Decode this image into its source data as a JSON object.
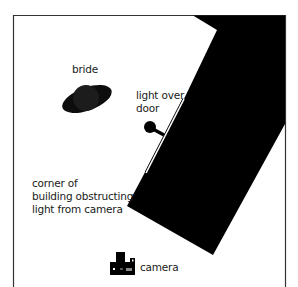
{
  "diagram": {
    "labels": {
      "bride": "bride",
      "light_line1": "light over",
      "light_line2": "door",
      "corner_line1": "corner of",
      "corner_line2": "building obstructing",
      "corner_line3": "light from camera",
      "camera": "camera"
    },
    "colors": {
      "background": "#ffffff",
      "frame": "#333333",
      "building": "#000000",
      "bride": "#111111",
      "door": "#ffffff",
      "text": "#1a1a1a"
    }
  }
}
